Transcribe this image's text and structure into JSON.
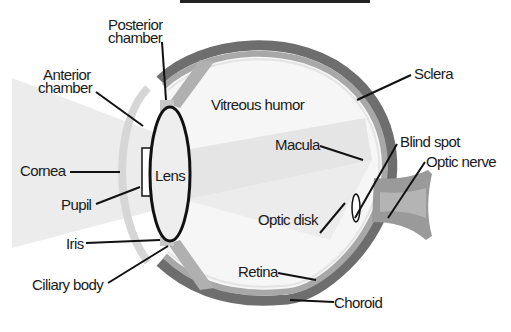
{
  "colors": {
    "background": "#ffffff",
    "light_cone": "#ececec",
    "sclera": "#6e6e6e",
    "choroid_band": "#a8a8a8",
    "retina_line": "#e8e8e8",
    "vitreous": "#f6f6f6",
    "cornea": "#d8d8d8",
    "lens_outline": "#111111",
    "optic_nerve": "#9a9a9a",
    "label_text": "#1a1a1a"
  },
  "labels": {
    "posterior_chamber": [
      "Posterior",
      "chamber"
    ],
    "anterior_chamber": [
      "Anterior",
      "chamber"
    ],
    "cornea": "Cornea",
    "pupil": "Pupil",
    "iris": "Iris",
    "ciliary_body": "Ciliary body",
    "lens": "Lens",
    "vitreous_humor": "Vitreous humor",
    "sclera": "Sclera",
    "macula": "Macula",
    "blind_spot": "Blind spot",
    "optic_nerve": "Optic nerve",
    "optic_disk": "Optic disk",
    "retina": "Retina",
    "choroid": "Choroid"
  }
}
